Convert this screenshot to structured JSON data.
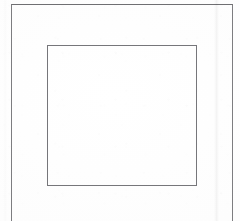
{
  "document": {
    "kind": "scanned-page",
    "content_text": "",
    "has_visible_text": false,
    "background_color": "#fdfdfd",
    "canvas": {
      "width": 240,
      "height": 221
    }
  },
  "frames": {
    "outer": {
      "name": "outer-border-frame",
      "stroke_color": "#7d7d80",
      "stroke_width": 1,
      "left": 11,
      "top": 4,
      "right": 233,
      "open_edge": "bottom"
    },
    "inner": {
      "name": "inner-border-rectangle",
      "stroke_color": "#76767a",
      "stroke_width": 1,
      "left": 47,
      "top": 45,
      "right": 197,
      "bottom": 186
    }
  },
  "artifacts": {
    "fold_streak": {
      "name": "vertical-fold-streak",
      "x": 216,
      "color": "#f0f0f0"
    },
    "gutter_streak": {
      "name": "left-gutter-streak",
      "x": 5,
      "color": "#f7f7f7"
    },
    "noise": {
      "name": "scanner-speckle",
      "color": "#000000"
    }
  }
}
